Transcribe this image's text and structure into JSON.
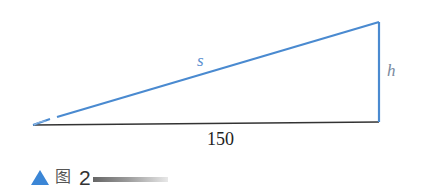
{
  "diagram": {
    "type": "right-triangle",
    "colors": {
      "blue": "#4a8ad0",
      "base": "#333333",
      "caption_triangle": "#3b86d6"
    },
    "vertices": {
      "left": [
        33,
        125
      ],
      "bottom_right": [
        379,
        122
      ],
      "top_right": [
        379,
        22
      ]
    },
    "labels": {
      "hypotenuse": "s",
      "height": "h",
      "base": "150"
    }
  },
  "caption": {
    "marker_icon": "triangle-up-icon",
    "prefix": "图",
    "number": "2"
  }
}
